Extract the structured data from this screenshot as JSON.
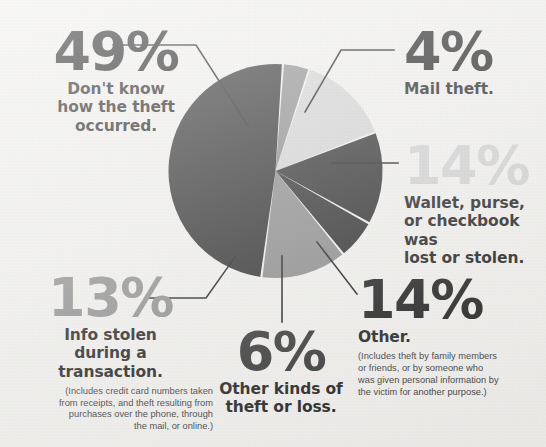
{
  "page": {
    "background_color": "#f2f1ee"
  },
  "palette": {
    "dark": "#2b2b2b",
    "mid_gray": "#8a8a8a",
    "light_gray": "#d4d4d4",
    "leader_line": "#1d1d1d",
    "text_dark": "#1d1d1d",
    "text_fine": "#3a3a3a"
  },
  "callouts": {
    "dont_know": {
      "percent": "49%",
      "headline": "Don't know\nhow the theft\noccurred.",
      "headline_lines": [
        "Don't know",
        "how the theft",
        "occurred."
      ],
      "fine_print": ""
    },
    "mail_theft": {
      "percent": "4%",
      "headline_lines": [
        "Mail theft."
      ],
      "fine_print": ""
    },
    "wallet": {
      "percent": "14%",
      "headline_lines": [
        "Wallet, purse,",
        "or checkbook was",
        "lost or stolen."
      ],
      "fine_print": ""
    },
    "other": {
      "percent": "14%",
      "headline_lines": [
        "Other."
      ],
      "fine_print_lines": [
        "(Includes theft by family members",
        "or friends, or by someone who",
        "was given personal information by",
        "the victim for another purpose.)"
      ]
    },
    "other_kinds": {
      "percent": "6%",
      "headline_lines": [
        "Other kinds of",
        "theft or loss."
      ],
      "fine_print": ""
    },
    "info_stolen": {
      "percent": "13%",
      "headline_lines": [
        "Info stolen",
        "during a",
        "transaction."
      ],
      "fine_print_lines": [
        "(Includes credit card numbers taken",
        "from receipts, and theft resulting from",
        "purchases over the phone, through",
        "the mail, or online.)"
      ]
    }
  },
  "chart_data": {
    "type": "pie",
    "unit": "percent",
    "legend_position": "callouts-around-pie",
    "grid": false,
    "center": [
      275.5,
      171
    ],
    "radius": 107,
    "start_angle_deg": -86,
    "categories": [
      "Mail theft.",
      "Wallet, purse, or checkbook was lost or stolen.",
      "Other.",
      "Other kinds of theft or loss.",
      "Info stolen during a transaction.",
      "Don't know how the theft occurred."
    ],
    "values": [
      4,
      14,
      14,
      6,
      13,
      49
    ],
    "colors": [
      "#8a8a8a",
      "#d4d4d4",
      "#2b2b2b",
      "#2b2b2b",
      "#8a8a8a",
      "#2b2b2b"
    ],
    "slices": [
      {
        "label": "Mail theft.",
        "value": 4,
        "color": "#8a8a8a"
      },
      {
        "label": "Wallet, purse, or checkbook was lost or stolen.",
        "value": 14,
        "color": "#d4d4d4"
      },
      {
        "label": "Other.",
        "value": 14,
        "color": "#2b2b2b"
      },
      {
        "label": "Other kinds of theft or loss.",
        "value": 6,
        "color": "#2b2b2b"
      },
      {
        "label": "Info stolen during a transaction.",
        "value": 13,
        "color": "#8a8a8a"
      },
      {
        "label": "Don't know how the theft occurred.",
        "value": 49,
        "color": "#2b2b2b"
      }
    ],
    "total": 100
  }
}
